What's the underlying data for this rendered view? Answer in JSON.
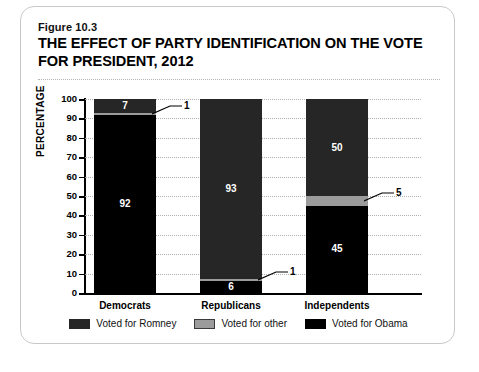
{
  "figure": {
    "number": "Figure 10.3",
    "title": "THE EFFECT OF PARTY IDENTIFICATION ON THE VOTE FOR PRESIDENT, 2012"
  },
  "chart_data": {
    "type": "bar",
    "subtype": "stacked-100",
    "title": "THE EFFECT OF PARTY IDENTIFICATION ON THE VOTE FOR PRESIDENT, 2012",
    "xlabel": "",
    "ylabel": "PERCENTAGE",
    "ylim": [
      0,
      100
    ],
    "ytick_step": 10,
    "yticks": [
      "100",
      "90",
      "80",
      "70",
      "60",
      "50",
      "40",
      "30",
      "20",
      "10",
      "0"
    ],
    "grid": true,
    "legend_position": "bottom",
    "categories": [
      "Democrats",
      "Republicans",
      "Independents"
    ],
    "series": [
      {
        "name": "Voted for Obama",
        "color": "#000000",
        "values": [
          92,
          6,
          45
        ]
      },
      {
        "name": "Voted for other",
        "color": "#9b9b9b",
        "values": [
          1,
          1,
          5
        ]
      },
      {
        "name": "Voted for Romney",
        "color": "#262626",
        "values": [
          7,
          93,
          50
        ]
      }
    ],
    "data_labels": {
      "Democrats": {
        "obama": "92",
        "other": "1",
        "romney": "7"
      },
      "Republicans": {
        "obama": "6",
        "other": "1",
        "romney": "93"
      },
      "Independents": {
        "obama": "45",
        "other": "5",
        "romney": "50"
      }
    },
    "callouts": [
      {
        "category": "Democrats",
        "segment": "other",
        "label": "1"
      },
      {
        "category": "Republicans",
        "segment": "other",
        "label": "1"
      },
      {
        "category": "Independents",
        "segment": "other",
        "label": "5"
      }
    ]
  },
  "legend": {
    "items": [
      {
        "label": "Voted for Romney",
        "color": "#262626"
      },
      {
        "label": "Voted for other",
        "color": "#9b9b9b"
      },
      {
        "label": "Voted for Obama",
        "color": "#000000"
      }
    ]
  }
}
